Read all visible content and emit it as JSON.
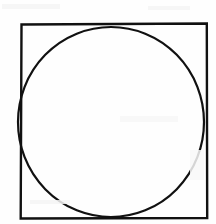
{
  "figure": {
    "background_color": "#fefefe",
    "stroke_color": "#111111",
    "canvas": {
      "width": 216,
      "height": 224
    },
    "shapes": [
      {
        "name": "square",
        "type": "rect",
        "x": 21,
        "y": 24,
        "width": 186,
        "height": 194,
        "stroke_width": 2.4,
        "fill": "none"
      },
      {
        "name": "circle",
        "type": "ellipse",
        "cx": 111,
        "cy": 122,
        "rx": 93,
        "ry": 95,
        "stroke_width": 2.2,
        "fill": "none"
      }
    ],
    "tangent_points": [
      {
        "label": "top",
        "x": 111,
        "y": 27
      },
      {
        "label": "left",
        "x": 21,
        "y": 122
      },
      {
        "label": "bottom",
        "x": 111,
        "y": 217
      },
      {
        "label": "right",
        "x": 204,
        "y": 122
      }
    ]
  }
}
